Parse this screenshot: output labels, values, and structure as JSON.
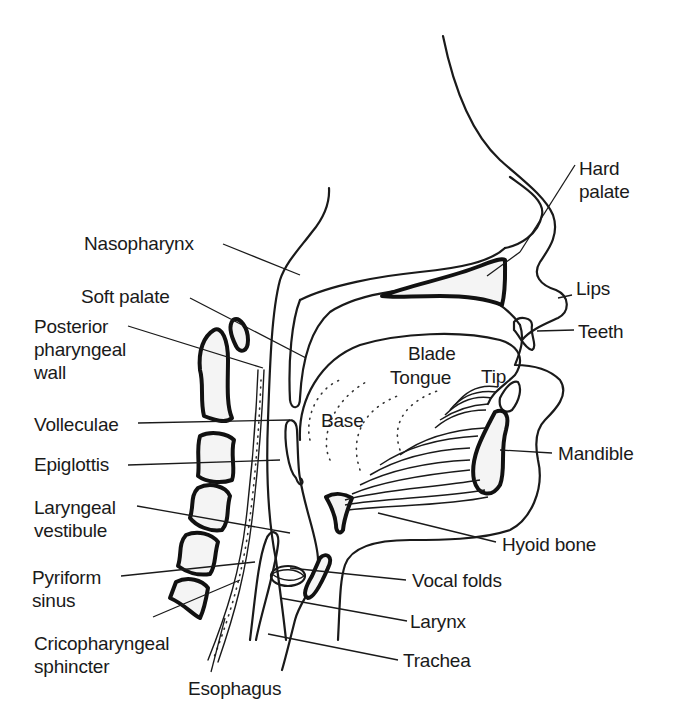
{
  "diagram": {
    "type": "anatomical-sagittal-section",
    "colors": {
      "ink": "#1a1a1a",
      "background": "#ffffff"
    }
  },
  "labels": {
    "hard_palate": "Hard\npalate",
    "nasopharynx": "Nasopharynx",
    "soft_palate": "Soft palate",
    "lips": "Lips",
    "posterior_pharyngeal_wall": "Posterior\npharyngeal\nwall",
    "teeth": "Teeth",
    "blade": "Blade",
    "tongue": "Tongue",
    "tip": "Tip",
    "base": "Base",
    "volleculae": "Volleculae",
    "epiglottis": "Epiglottis",
    "mandible": "Mandible",
    "laryngeal_vestibule": "Laryngeal\nvestibule",
    "hyoid_bone": "Hyoid bone",
    "pyriform_sinus": "Pyriform\nsinus",
    "vocal_folds": "Vocal folds",
    "larynx": "Larynx",
    "cricopharyngeal_sphincter": "Cricopharyngeal\nsphincter",
    "trachea": "Trachea",
    "esophagus": "Esophagus"
  }
}
